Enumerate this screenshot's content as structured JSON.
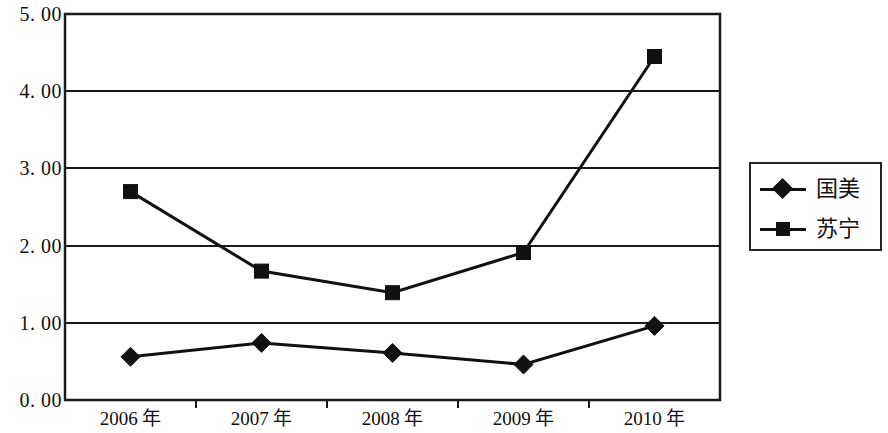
{
  "chart_data": {
    "type": "line",
    "title": "",
    "subtitle": "",
    "xlabel": "",
    "ylabel": "",
    "categories": [
      "2006 年",
      "2007 年",
      "2008 年",
      "2009 年",
      "2010 年"
    ],
    "series": [
      {
        "name": "国美",
        "marker": "diamond",
        "color": "#111111",
        "values": [
          0.56,
          0.74,
          0.61,
          0.46,
          0.96
        ]
      },
      {
        "name": "苏宁",
        "marker": "square",
        "color": "#111111",
        "values": [
          2.7,
          1.67,
          1.39,
          1.91,
          4.45
        ]
      }
    ],
    "ylim": [
      0.0,
      5.0
    ],
    "y_ticks": [
      0.0,
      1.0,
      2.0,
      3.0,
      4.0,
      5.0
    ],
    "y_tick_labels": [
      "0. 00",
      "1. 00",
      "2. 00",
      "3. 00",
      "4. 00",
      "5. 00"
    ],
    "grid": true,
    "grid_axis": "y",
    "legend_position": "right"
  },
  "legend": {
    "items": [
      {
        "label": "国美",
        "marker": "diamond"
      },
      {
        "label": "苏宁",
        "marker": "square"
      }
    ]
  },
  "axes": {
    "y_labels": [
      "5. 00",
      "4. 00",
      "3. 00",
      "2. 00",
      "1. 00",
      "0. 00"
    ],
    "x_labels": [
      "2006 年",
      "2007 年",
      "2008 年",
      "2009 年",
      "2010 年"
    ]
  }
}
